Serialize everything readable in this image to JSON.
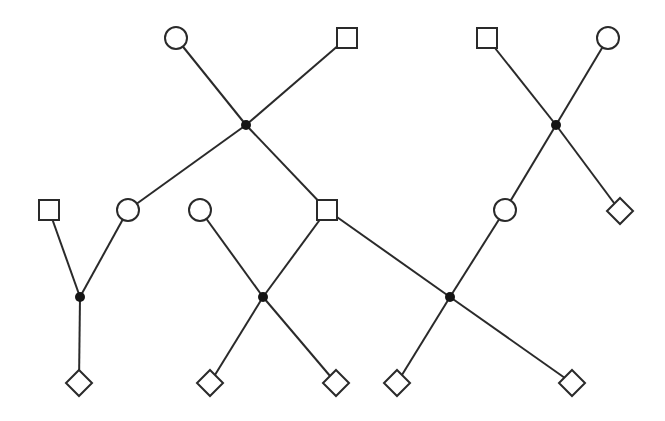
{
  "diagram": {
    "type": "graph",
    "colors": {
      "stroke": "#2a2a2a",
      "hub": "#151515",
      "background": "#ffffff"
    },
    "nodes": [
      {
        "id": "c1",
        "shape": "circle",
        "x": 176,
        "y": 38
      },
      {
        "id": "s1",
        "shape": "square",
        "x": 347,
        "y": 38
      },
      {
        "id": "s2",
        "shape": "square",
        "x": 487,
        "y": 38
      },
      {
        "id": "c2",
        "shape": "circle",
        "x": 608,
        "y": 38
      },
      {
        "id": "h1",
        "shape": "hub",
        "x": 246,
        "y": 125
      },
      {
        "id": "h2",
        "shape": "hub",
        "x": 556,
        "y": 125
      },
      {
        "id": "s3",
        "shape": "square",
        "x": 49,
        "y": 210
      },
      {
        "id": "c3",
        "shape": "circle",
        "x": 128,
        "y": 210
      },
      {
        "id": "c4",
        "shape": "circle",
        "x": 200,
        "y": 210
      },
      {
        "id": "s4",
        "shape": "square",
        "x": 327,
        "y": 210
      },
      {
        "id": "c5",
        "shape": "circle",
        "x": 505,
        "y": 210
      },
      {
        "id": "d1",
        "shape": "diamond",
        "x": 620,
        "y": 211
      },
      {
        "id": "h3",
        "shape": "hub",
        "x": 80,
        "y": 297
      },
      {
        "id": "h4",
        "shape": "hub",
        "x": 263,
        "y": 297
      },
      {
        "id": "h5",
        "shape": "hub",
        "x": 450,
        "y": 297
      },
      {
        "id": "d2",
        "shape": "diamond",
        "x": 79,
        "y": 383
      },
      {
        "id": "d3",
        "shape": "diamond",
        "x": 210,
        "y": 383
      },
      {
        "id": "d4",
        "shape": "diamond",
        "x": 336,
        "y": 383
      },
      {
        "id": "d5",
        "shape": "diamond",
        "x": 397,
        "y": 383
      },
      {
        "id": "d6",
        "shape": "diamond",
        "x": 572,
        "y": 383
      }
    ],
    "edges": [
      [
        "c1",
        "h1"
      ],
      [
        "s1",
        "h1"
      ],
      [
        "h1",
        "c3"
      ],
      [
        "h1",
        "s4"
      ],
      [
        "s2",
        "h2"
      ],
      [
        "c2",
        "h2"
      ],
      [
        "h2",
        "c5"
      ],
      [
        "h2",
        "d1"
      ],
      [
        "s3",
        "h3"
      ],
      [
        "c3",
        "h3"
      ],
      [
        "h3",
        "d2"
      ],
      [
        "c4",
        "h4"
      ],
      [
        "s4",
        "h4"
      ],
      [
        "h4",
        "d3"
      ],
      [
        "h4",
        "d4"
      ],
      [
        "s4",
        "h5"
      ],
      [
        "c5",
        "h5"
      ],
      [
        "h5",
        "d5"
      ],
      [
        "h5",
        "d6"
      ]
    ]
  }
}
